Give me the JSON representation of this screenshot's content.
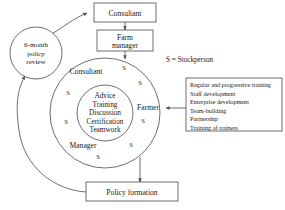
{
  "diagram": {
    "background_color": "#ffffff",
    "line_color": "#4a4a4a",
    "text_color": "#1a1a1a"
  },
  "nodes": {
    "review_circle": {
      "lines": [
        "6-month",
        "policy",
        "review"
      ]
    },
    "consultant_box": {
      "label": "Consultant"
    },
    "farm_manager_box": {
      "lines": [
        "Farm",
        "manager"
      ]
    },
    "policy_formation_box": {
      "label": "Policy formation"
    }
  },
  "ring_roles": [
    {
      "label": "Consultant"
    },
    {
      "label": "Farmer"
    },
    {
      "label": "Manager"
    }
  ],
  "core_items": [
    {
      "label": "Advice"
    },
    {
      "label": "Training"
    },
    {
      "label": "Discussion"
    },
    {
      "label": "Certification"
    },
    {
      "label": "Teamwork"
    }
  ],
  "stockperson_markers": [
    {
      "label": "S",
      "x": 124,
      "y": 70
    },
    {
      "label": "S",
      "x": 140,
      "y": 85
    },
    {
      "label": "S",
      "x": 143,
      "y": 123
    },
    {
      "label": "S",
      "x": 131,
      "y": 147
    },
    {
      "label": "S",
      "x": 98,
      "y": 159
    },
    {
      "label": "S",
      "x": 68,
      "y": 95
    },
    {
      "label": "S",
      "x": 66,
      "y": 124
    }
  ],
  "legend": {
    "text": "S = Stockperson"
  },
  "training_box": {
    "items": [
      "Regular and progressive training",
      "Staff development",
      "Enterprise development",
      "Team-building",
      "Partnership",
      "Training of trainers"
    ]
  }
}
